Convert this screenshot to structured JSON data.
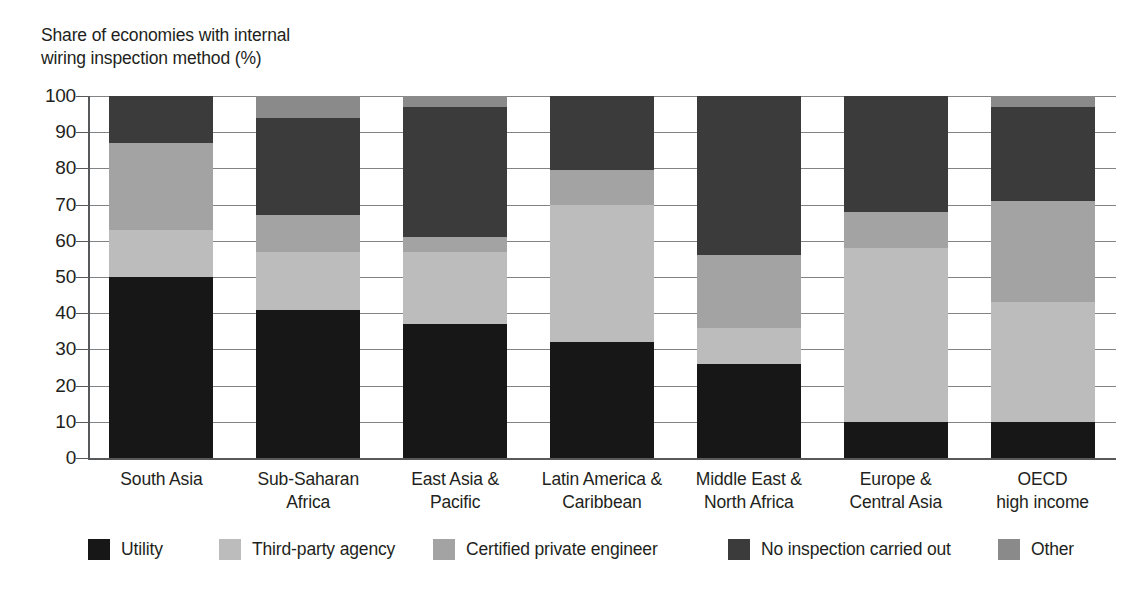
{
  "chart_data": {
    "type": "bar",
    "title": "Share of economies with internal\nwiring inspection method (%)",
    "subtitle": "",
    "xlabel": "",
    "ylabel": "",
    "stacked": true,
    "grid": true,
    "legend_position": "bottom",
    "ylim": [
      0,
      100
    ],
    "yticks": [
      0,
      10,
      20,
      30,
      40,
      50,
      60,
      70,
      80,
      90,
      100
    ],
    "ytick_labels": [
      "0",
      "10",
      "20",
      "30",
      "40",
      "50",
      "60",
      "70",
      "80",
      "90",
      "100"
    ],
    "categories": [
      "South Asia",
      "Sub-Saharan\nAfrica",
      "East Asia &\nPacific",
      "Latin America &\nCaribbean",
      "Middle East &\nNorth Africa",
      "Europe &\nCentral Asia",
      "OECD\nhigh income"
    ],
    "series": [
      {
        "name": "Utility",
        "color": "#171717",
        "values": [
          50,
          41,
          37,
          32,
          26,
          10,
          10
        ]
      },
      {
        "name": "Third-party agency",
        "color": "#bcbcbc",
        "values": [
          13,
          16,
          20,
          38,
          10,
          48,
          33
        ]
      },
      {
        "name": "Certified private engineer",
        "color": "#a3a3a3",
        "values": [
          24,
          10,
          4,
          9.5,
          20,
          10,
          28
        ]
      },
      {
        "name": "No inspection carried out",
        "color": "#3b3b3b",
        "values": [
          13,
          27,
          36,
          20.5,
          44,
          32,
          26
        ]
      },
      {
        "name": "Other",
        "color": "#8a8a8a",
        "values": [
          0,
          6,
          3,
          0,
          0,
          0,
          3
        ]
      }
    ]
  },
  "legend": {
    "items": [
      {
        "label": "Utility",
        "color": "#171717"
      },
      {
        "label": "Third-party agency",
        "color": "#bcbcbc"
      },
      {
        "label": "Certified private engineer",
        "color": "#a3a3a3"
      },
      {
        "label": "No inspection carried out",
        "color": "#3b3b3b"
      },
      {
        "label": "Other",
        "color": "#8a8a8a"
      }
    ]
  },
  "colors": {
    "axis": "#58595b",
    "text": "#231f20",
    "background": "#ffffff"
  }
}
